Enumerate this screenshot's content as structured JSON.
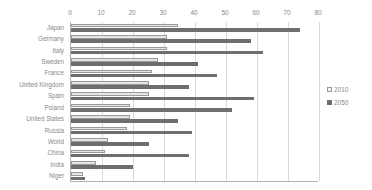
{
  "chart_data": {
    "type": "bar",
    "orientation": "horizontal",
    "title": "",
    "subtitle": "",
    "xlabel": "",
    "ylabel": "",
    "xlim": [
      0,
      80
    ],
    "xticks": [
      0,
      10,
      20,
      30,
      40,
      50,
      60,
      70,
      80
    ],
    "xtick_labels": [
      "0",
      "10",
      "20",
      "30",
      "40",
      "50",
      "60",
      "70",
      "80"
    ],
    "grid": true,
    "legend_position": "right",
    "categories": [
      "Japan",
      "Germany",
      "Italy",
      "Sweden",
      "France",
      "United Kingdom",
      "Spain",
      "Poland",
      "United States",
      "Russia",
      "World",
      "China",
      "India",
      "Niger"
    ],
    "series": [
      {
        "name": "2010",
        "color": "#e6e6e6",
        "values": [
          34.5,
          31,
          31,
          28,
          26,
          25,
          25,
          19,
          19,
          18,
          12,
          11,
          8,
          4
        ]
      },
      {
        "name": "2050",
        "color": "#6e6e6e",
        "values": [
          74,
          58,
          62,
          41,
          47,
          38,
          59,
          52,
          34.5,
          39,
          25,
          38,
          20,
          4.5
        ]
      }
    ]
  },
  "legend": {
    "items": [
      {
        "label": "2010",
        "swatch": "legend-swatch-2010"
      },
      {
        "label": "2050",
        "swatch": "legend-swatch-2050"
      }
    ]
  },
  "colors": {
    "series_2010": "#e6e6e6",
    "series_2050": "#6e6e6e",
    "gridline": "#d9d9d9",
    "axis": "#b0b0b0",
    "text": "#8a8a8a",
    "background": "#ffffff"
  }
}
